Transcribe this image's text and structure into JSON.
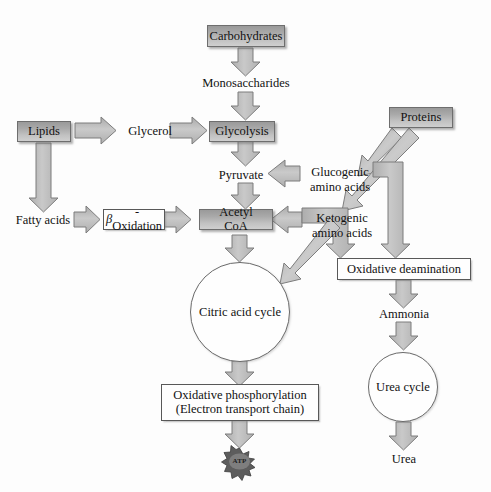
{
  "diagram": {
    "background_color": "#fdfdfd",
    "node_fill_color": "#a9a9a9",
    "node_border_color": "#6e6e6e",
    "arrow_fill_color": "#bdbdbd",
    "arrow_border_color": "#7a7a7a",
    "text_color": "#111111"
  },
  "nodes": {
    "carbohydrates": {
      "label": "Carbohydrates",
      "shape": "filled-box"
    },
    "monosaccharides": {
      "label": "Monosaccharides",
      "shape": "text"
    },
    "glycolysis": {
      "label": "Glycolysis",
      "shape": "filled-box"
    },
    "pyruvate": {
      "label": "Pyruvate",
      "shape": "text"
    },
    "acetyl_coa": {
      "label": "Acetyl CoA",
      "shape": "filled-box"
    },
    "lipids": {
      "label": "Lipids",
      "shape": "filled-box"
    },
    "glycerol": {
      "label": "Glycerol",
      "shape": "text"
    },
    "fatty_acids": {
      "label": "Fatty acids",
      "shape": "text"
    },
    "beta_oxidation": {
      "label_prefix": "β",
      "label_suffix": "-Oxidation",
      "shape": "plain-box"
    },
    "proteins": {
      "label": "Proteins",
      "shape": "filled-box"
    },
    "glucogenic_amino_acids": {
      "line1": "Glucogenic",
      "line2": "amino acids",
      "shape": "text"
    },
    "ketogenic_amino_acids": {
      "line1": "Ketogenic",
      "line2": "amino acids",
      "shape": "text"
    },
    "oxidative_deamination": {
      "label": "Oxidative deamination",
      "shape": "plain-box"
    },
    "ammonia": {
      "label": "Ammonia",
      "shape": "text"
    },
    "urea_cycle": {
      "label": "Urea cycle",
      "shape": "circle"
    },
    "urea": {
      "label": "Urea",
      "shape": "text"
    },
    "citric_acid_cycle": {
      "label": "Citric acid cycle",
      "shape": "circle"
    },
    "oxidative_phosphorylation": {
      "line1": "Oxidative phosphorylation",
      "line2": "(Electron transport chain)",
      "shape": "plain-box"
    },
    "atp": {
      "label": "ATP",
      "shape": "starburst"
    }
  },
  "edges": [
    {
      "from": "carbohydrates",
      "to": "monosaccharides",
      "direction": "down"
    },
    {
      "from": "monosaccharides",
      "to": "glycolysis",
      "direction": "down"
    },
    {
      "from": "glycolysis",
      "to": "pyruvate",
      "direction": "down"
    },
    {
      "from": "pyruvate",
      "to": "acetyl_coa",
      "direction": "down"
    },
    {
      "from": "lipids",
      "to": "glycerol",
      "direction": "right"
    },
    {
      "from": "glycerol",
      "to": "glycolysis",
      "direction": "right"
    },
    {
      "from": "lipids",
      "to": "fatty_acids",
      "direction": "down"
    },
    {
      "from": "fatty_acids",
      "to": "beta_oxidation",
      "direction": "right"
    },
    {
      "from": "beta_oxidation",
      "to": "acetyl_coa",
      "direction": "right"
    },
    {
      "from": "glucogenic_amino_acids",
      "to": "pyruvate",
      "direction": "left"
    },
    {
      "from": "ketogenic_amino_acids",
      "to": "acetyl_coa",
      "direction": "left"
    },
    {
      "from": "proteins",
      "to": "glucogenic_amino_acids",
      "direction": "diagonal-down-left"
    },
    {
      "from": "proteins",
      "to": "ketogenic_amino_acids",
      "direction": "diagonal-down-left"
    },
    {
      "from": "glucogenic_amino_acids",
      "to": "oxidative_deamination",
      "direction": "elbow-down"
    },
    {
      "from": "ketogenic_amino_acids",
      "to": "oxidative_deamination",
      "direction": "elbow-down"
    },
    {
      "from": "oxidative_deamination",
      "to": "ammonia",
      "direction": "down"
    },
    {
      "from": "ammonia",
      "to": "urea_cycle",
      "direction": "down"
    },
    {
      "from": "urea_cycle",
      "to": "urea",
      "direction": "down"
    },
    {
      "from": "acetyl_coa",
      "to": "citric_acid_cycle",
      "direction": "down"
    },
    {
      "from": "ketogenic_amino_acids",
      "to": "citric_acid_cycle",
      "direction": "diagonal-down-left"
    },
    {
      "from": "citric_acid_cycle",
      "to": "oxidative_phosphorylation",
      "direction": "down"
    },
    {
      "from": "oxidative_phosphorylation",
      "to": "atp",
      "direction": "down"
    }
  ]
}
